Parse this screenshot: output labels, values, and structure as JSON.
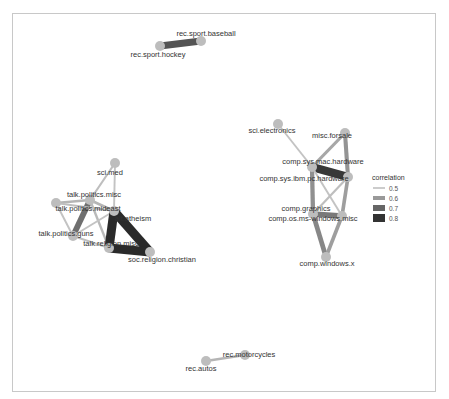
{
  "chart_data": {
    "type": "network",
    "title": "",
    "legend": {
      "title": "correlation",
      "position": "right",
      "entries": [
        {
          "label": "0.5",
          "color": "#cccccc",
          "width": 2
        },
        {
          "label": "0.6",
          "color": "#999999",
          "width": 4
        },
        {
          "label": "0.7",
          "color": "#666666",
          "width": 6
        },
        {
          "label": "0.8",
          "color": "#333333",
          "width": 8
        }
      ]
    },
    "nodes": [
      {
        "id": "rec.sport.baseball",
        "x": 201,
        "y": 41,
        "lx": 206,
        "ly": 36,
        "anchor": "middle"
      },
      {
        "id": "rec.sport.hockey",
        "x": 160,
        "y": 46,
        "lx": 158,
        "ly": 57,
        "anchor": "middle"
      },
      {
        "id": "sci.med",
        "x": 115,
        "y": 163,
        "lx": 110,
        "ly": 175,
        "anchor": "middle"
      },
      {
        "id": "talk.politics.misc",
        "x": 90,
        "y": 200,
        "lx": 94,
        "ly": 197,
        "anchor": "middle"
      },
      {
        "id": "talk.politics.mideast",
        "x": 56,
        "y": 203,
        "lx": 88,
        "ly": 211,
        "anchor": "middle"
      },
      {
        "id": "alt.atheism",
        "x": 114,
        "y": 211,
        "lx": 133,
        "ly": 221,
        "anchor": "middle"
      },
      {
        "id": "talk.politics.guns",
        "x": 73,
        "y": 236,
        "lx": 66,
        "ly": 236,
        "anchor": "middle"
      },
      {
        "id": "talk.religion.misc",
        "x": 109,
        "y": 248,
        "lx": 111,
        "ly": 246,
        "anchor": "middle"
      },
      {
        "id": "soc.religion.christian",
        "x": 150,
        "y": 252,
        "lx": 162,
        "ly": 262,
        "anchor": "middle"
      },
      {
        "id": "sci.electronics",
        "x": 278,
        "y": 124,
        "lx": 272,
        "ly": 133,
        "anchor": "middle"
      },
      {
        "id": "misc.forsale",
        "x": 345,
        "y": 133,
        "lx": 332,
        "ly": 138,
        "anchor": "middle"
      },
      {
        "id": "comp.sys.mac.hardware",
        "x": 312,
        "y": 167,
        "lx": 323,
        "ly": 164,
        "anchor": "middle"
      },
      {
        "id": "comp.sys.ibm.pc.hardware",
        "x": 348,
        "y": 177,
        "lx": 304,
        "ly": 181,
        "anchor": "middle"
      },
      {
        "id": "comp.graphics",
        "x": 313,
        "y": 214,
        "lx": 306,
        "ly": 211,
        "anchor": "middle"
      },
      {
        "id": "comp.os.ms-windows.misc",
        "x": 342,
        "y": 216,
        "lx": 313,
        "ly": 221,
        "anchor": "middle"
      },
      {
        "id": "comp.windows.x",
        "x": 326,
        "y": 257,
        "lx": 327,
        "ly": 266,
        "anchor": "middle"
      },
      {
        "id": "rec.autos",
        "x": 206,
        "y": 361,
        "lx": 201,
        "ly": 371,
        "anchor": "middle"
      },
      {
        "id": "rec.motorcycles",
        "x": 245,
        "y": 355,
        "lx": 249,
        "ly": 357,
        "anchor": "middle"
      }
    ],
    "edges": [
      {
        "source": "rec.sport.hockey",
        "target": "rec.sport.baseball",
        "correlation": 0.76
      },
      {
        "source": "sci.med",
        "target": "talk.politics.misc",
        "correlation": 0.53
      },
      {
        "source": "sci.med",
        "target": "alt.atheism",
        "correlation": 0.52
      },
      {
        "source": "talk.politics.misc",
        "target": "talk.politics.mideast",
        "correlation": 0.55
      },
      {
        "source": "talk.politics.misc",
        "target": "talk.politics.guns",
        "correlation": 0.7
      },
      {
        "source": "talk.politics.misc",
        "target": "alt.atheism",
        "correlation": 0.55
      },
      {
        "source": "talk.politics.misc",
        "target": "talk.religion.misc",
        "correlation": 0.54
      },
      {
        "source": "talk.politics.mideast",
        "target": "talk.politics.guns",
        "correlation": 0.52
      },
      {
        "source": "talk.politics.mideast",
        "target": "alt.atheism",
        "correlation": 0.53
      },
      {
        "source": "talk.politics.guns",
        "target": "alt.atheism",
        "correlation": 0.52
      },
      {
        "source": "talk.politics.guns",
        "target": "talk.religion.misc",
        "correlation": 0.53
      },
      {
        "source": "alt.atheism",
        "target": "talk.religion.misc",
        "correlation": 0.85
      },
      {
        "source": "alt.atheism",
        "target": "soc.religion.christian",
        "correlation": 0.85
      },
      {
        "source": "talk.religion.misc",
        "target": "soc.religion.christian",
        "correlation": 0.85
      },
      {
        "source": "sci.electronics",
        "target": "comp.sys.mac.hardware",
        "correlation": 0.52
      },
      {
        "source": "misc.forsale",
        "target": "comp.sys.mac.hardware",
        "correlation": 0.58
      },
      {
        "source": "misc.forsale",
        "target": "comp.sys.ibm.pc.hardware",
        "correlation": 0.62
      },
      {
        "source": "comp.sys.mac.hardware",
        "target": "comp.sys.ibm.pc.hardware",
        "correlation": 0.82
      },
      {
        "source": "comp.sys.mac.hardware",
        "target": "comp.graphics",
        "correlation": 0.63
      },
      {
        "source": "comp.sys.mac.hardware",
        "target": "comp.os.ms-windows.misc",
        "correlation": 0.52
      },
      {
        "source": "comp.sys.ibm.pc.hardware",
        "target": "comp.graphics",
        "correlation": 0.53
      },
      {
        "source": "comp.sys.ibm.pc.hardware",
        "target": "comp.os.ms-windows.misc",
        "correlation": 0.6
      },
      {
        "source": "comp.graphics",
        "target": "comp.os.ms-windows.misc",
        "correlation": 0.68
      },
      {
        "source": "comp.graphics",
        "target": "comp.windows.x",
        "correlation": 0.65
      },
      {
        "source": "comp.os.ms-windows.misc",
        "target": "comp.windows.x",
        "correlation": 0.6
      },
      {
        "source": "rec.autos",
        "target": "rec.motorcycles",
        "correlation": 0.55
      }
    ]
  },
  "style": {
    "node_color": "#bdbdbd",
    "node_radius": 5,
    "frame_color": "#c8c8c8"
  }
}
